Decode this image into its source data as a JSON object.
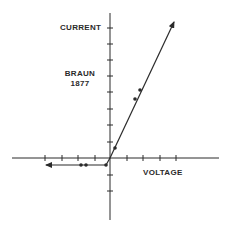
{
  "diagram": {
    "title": "BRAUN",
    "year": "1877",
    "y_axis_label": "CURRENT",
    "x_axis_label": "VOLTAGE",
    "line_color": "#2a2a2a",
    "axes": {
      "origin": [
        110,
        158
      ],
      "y_ticks_positive": 8,
      "y_ticks_negative": 2,
      "x_ticks_positive": 4,
      "x_ticks_negative": 4
    },
    "curve": {
      "forward_branch": {
        "from": [
          110,
          158
        ],
        "to": [
          174,
          22
        ],
        "points": [
          [
            115,
            148
          ],
          [
            135,
            99
          ],
          [
            140,
            90
          ]
        ]
      },
      "reverse_branch": {
        "from": [
          106,
          165
        ],
        "to": [
          46,
          165
        ],
        "points": [
          [
            81,
            165
          ],
          [
            86,
            165
          ],
          [
            106,
            165
          ]
        ]
      }
    }
  }
}
